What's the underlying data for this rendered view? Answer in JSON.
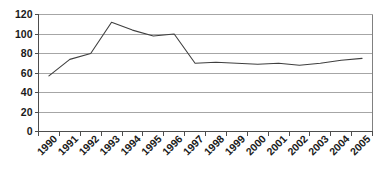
{
  "chart_data": {
    "type": "line",
    "title": "",
    "subtitle": "",
    "xlabel": "",
    "ylabel": "",
    "categories": [
      "1990",
      "1991",
      "1992",
      "1993",
      "1994",
      "1995",
      "1996",
      "1997",
      "1998",
      "1999",
      "2000",
      "2001",
      "2002",
      "2003",
      "2004",
      "2005"
    ],
    "series": [
      {
        "name": "",
        "values": [
          57,
          74,
          80,
          112,
          104,
          98,
          100,
          70,
          71,
          70,
          69,
          70,
          68,
          70,
          73,
          75
        ]
      }
    ],
    "ylim": [
      0,
      120
    ],
    "ytick_values": [
      0,
      20,
      40,
      60,
      80,
      100,
      120
    ],
    "ytick_labels": [
      "0",
      "20",
      "40",
      "60",
      "80",
      "100",
      "120"
    ],
    "ytick_step": 20,
    "grid": true,
    "grid_axis": "y",
    "legend": false,
    "legend_position": "none",
    "markers": false,
    "xtick_rotation": 45,
    "colors": {
      "background": "#ffffff",
      "line": "#3f3f3f",
      "gridline": "#a6a6a6",
      "axis": "#4d4d4d",
      "plot_border": "#808080",
      "tick_label": "#1a1a1a"
    }
  }
}
